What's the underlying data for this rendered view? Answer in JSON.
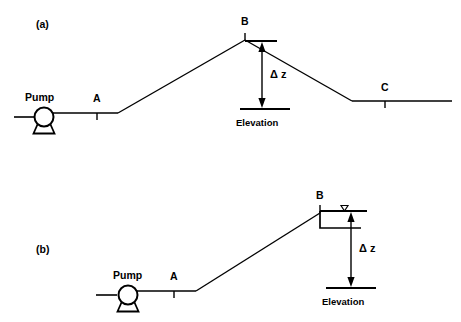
{
  "figure": {
    "background_color": "#ffffff",
    "line_color": "#000000"
  },
  "panels": [
    {
      "id": "a",
      "label": "(a)",
      "description": "Pump discharging over a hill to a lower outlet C",
      "pump_label": "Pump",
      "points": [
        {
          "name": "A",
          "label": "A",
          "tick": "below"
        },
        {
          "name": "B",
          "label": "B",
          "tick": "above"
        },
        {
          "name": "C",
          "label": "C",
          "tick": "below"
        }
      ],
      "dimension": {
        "label": "Δ z",
        "symbol": "delta-z",
        "arrow": "double-headed-vertical"
      },
      "datum_label": "Elevation"
    },
    {
      "id": "b",
      "label": "(b)",
      "description": "Pump discharging up into an elevated open tank at B",
      "pump_label": "Pump",
      "points": [
        {
          "name": "A",
          "label": "A",
          "tick": "below"
        },
        {
          "name": "B",
          "label": "B",
          "tick": "above"
        }
      ],
      "tank": {
        "water_surface_symbol": "▽",
        "name": "open-tank"
      },
      "dimension": {
        "label": "Δ z",
        "symbol": "delta-z",
        "arrow": "double-headed-vertical"
      },
      "datum_label": "Elevation"
    }
  ]
}
